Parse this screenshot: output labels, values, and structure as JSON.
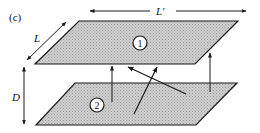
{
  "figure": {
    "panel_label": "(c)",
    "dimensions": {
      "length_label": "L",
      "width_label": "L'",
      "separation_label": "D"
    },
    "plates": [
      {
        "id": "plate-1",
        "label": "1"
      },
      {
        "id": "plate-2",
        "label": "2"
      }
    ],
    "colors": {
      "plate_fill": "#c9c9c9",
      "stroke": "#1a1a1a"
    }
  }
}
